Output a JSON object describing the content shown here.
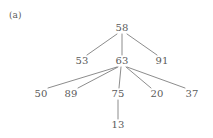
{
  "figure": {
    "panel_label": "(a)",
    "background_color": "#ffffff",
    "text_color": "#5a5a5a",
    "edge_color": "#6e6e6e",
    "width": 213,
    "height": 138
  },
  "chart_data": {
    "type": "diagram",
    "diagram_kind": "tree",
    "title": "(a)",
    "nodes": [
      {
        "id": "n58",
        "label": "58",
        "x": 122,
        "y": 28,
        "level": 0
      },
      {
        "id": "n53",
        "label": "53",
        "x": 82,
        "y": 61,
        "level": 1
      },
      {
        "id": "n63",
        "label": "63",
        "x": 122,
        "y": 61,
        "level": 1
      },
      {
        "id": "n91",
        "label": "91",
        "x": 162,
        "y": 61,
        "level": 1
      },
      {
        "id": "n50",
        "label": "50",
        "x": 41,
        "y": 94,
        "level": 2
      },
      {
        "id": "n89",
        "label": "89",
        "x": 71,
        "y": 94,
        "level": 2
      },
      {
        "id": "n75",
        "label": "75",
        "x": 118,
        "y": 94,
        "level": 2
      },
      {
        "id": "n20",
        "label": "20",
        "x": 157,
        "y": 94,
        "level": 2
      },
      {
        "id": "n37",
        "label": "37",
        "x": 192,
        "y": 94,
        "level": 2
      },
      {
        "id": "n13",
        "label": "13",
        "x": 118,
        "y": 125,
        "level": 3
      }
    ],
    "edges": [
      {
        "from": "n58",
        "to": "n53",
        "x1": 117,
        "y1": 34,
        "x2": 87,
        "y2": 55
      },
      {
        "from": "n58",
        "to": "n63",
        "x1": 122,
        "y1": 34,
        "x2": 122,
        "y2": 55
      },
      {
        "from": "n58",
        "to": "n91",
        "x1": 127,
        "y1": 34,
        "x2": 157,
        "y2": 55
      },
      {
        "from": "n63",
        "to": "n50",
        "x1": 117,
        "y1": 67,
        "x2": 48,
        "y2": 88
      },
      {
        "from": "n63",
        "to": "n89",
        "x1": 118,
        "y1": 67,
        "x2": 78,
        "y2": 88
      },
      {
        "from": "n63",
        "to": "n75",
        "x1": 121,
        "y1": 67,
        "x2": 119,
        "y2": 88
      },
      {
        "from": "n63",
        "to": "n20",
        "x1": 126,
        "y1": 67,
        "x2": 151,
        "y2": 88
      },
      {
        "from": "n63",
        "to": "n37",
        "x1": 127,
        "y1": 67,
        "x2": 185,
        "y2": 88
      },
      {
        "from": "n75",
        "to": "n13",
        "x1": 118,
        "y1": 100,
        "x2": 118,
        "y2": 119
      }
    ],
    "root": "n58",
    "values": [
      58,
      53,
      63,
      91,
      50,
      89,
      75,
      20,
      37,
      13
    ],
    "xlabel": "",
    "ylabel": "",
    "legend": []
  }
}
